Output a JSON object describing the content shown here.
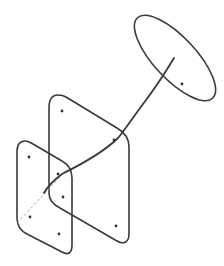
{
  "diagram": {
    "width": 224,
    "height": 266,
    "background": "#ffffff",
    "stroke_color": "#3a3a3a",
    "dot_color": "#333333",
    "dashed_color": "#9a9a9a",
    "elements": {
      "ellipse": {
        "cx": 175,
        "cy": 58,
        "rx": 55,
        "ry": 21,
        "rotation": 47
      },
      "curve": {
        "d": "M174 58 C168 68, 158 84, 146 100 C134 116, 126 128, 118 138 C104 152, 82 164, 62 174 C54 180, 48 186, 44 193"
      },
      "large_plane": {
        "d": "M58 95 C52 95, 49 100, 49 108 L49 193 C49 201, 54 205, 60 208 L117 241 C124 245, 129 242, 129 234 L129 147 C129 139, 124 132, 117 128 L66 97 C63 95, 60 95, 58 95 Z"
      },
      "small_plane": {
        "d": "M25 141 C19 141, 17 146, 17 152 L17 218 C17 226, 21 231, 27 234 L62 252 C69 256, 72 252, 72 245 L72 178 C72 170, 69 165, 62 161 L33 144 C30 142, 28 141, 25 141 Z"
      },
      "dashed_line": {
        "x1": 17,
        "y1": 223,
        "x2": 72,
        "y2": 164
      },
      "dots": [
        {
          "cx": 182,
          "cy": 84
        },
        {
          "cx": 62,
          "cy": 111
        },
        {
          "cx": 114,
          "cy": 140
        },
        {
          "cx": 116,
          "cy": 226
        },
        {
          "cx": 29,
          "cy": 157
        },
        {
          "cx": 58,
          "cy": 174
        },
        {
          "cx": 63,
          "cy": 197
        },
        {
          "cx": 30,
          "cy": 217
        },
        {
          "cx": 59,
          "cy": 234
        }
      ]
    }
  }
}
